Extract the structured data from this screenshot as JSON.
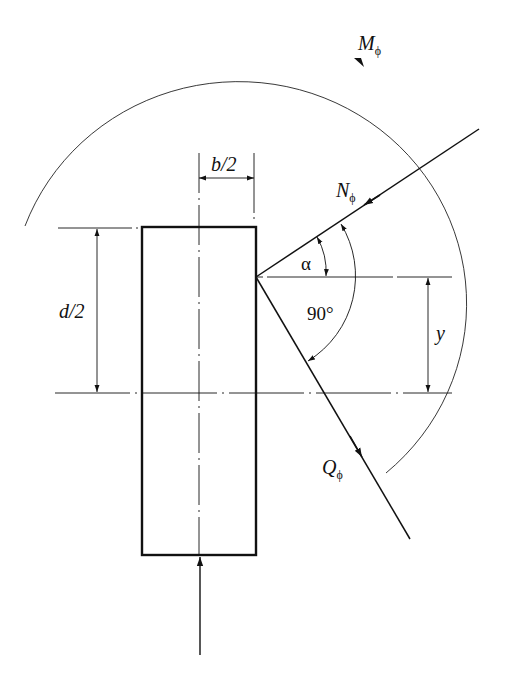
{
  "diagram": {
    "labels": {
      "moment": "M",
      "moment_sub": "ϕ",
      "normal": "N",
      "normal_sub": "ϕ",
      "shear": "Q",
      "shear_sub": "ϕ",
      "half_width": "b/2",
      "half_depth": "d/2",
      "angle_alpha": "α",
      "angle_right": "90°",
      "offset_y": "y"
    },
    "colors": {
      "line": "#111111",
      "background": "#ffffff"
    }
  }
}
